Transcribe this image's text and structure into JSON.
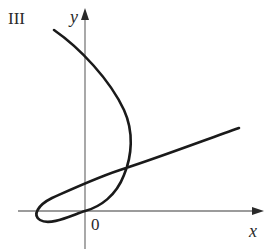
{
  "figure": {
    "panel_label": "III",
    "axes": {
      "x_label": "x",
      "y_label": "y",
      "origin_label": "0"
    },
    "colors": {
      "axis": "#7a7a7a",
      "curve": "#1a1a1a",
      "text": "#2a2a2a",
      "background": "#ffffff"
    },
    "curve_description": "Parametric curve starting upper-left, bending right to a maximum x, then looping back through the origin region and continuing as a nearly straight line rising to the right"
  }
}
